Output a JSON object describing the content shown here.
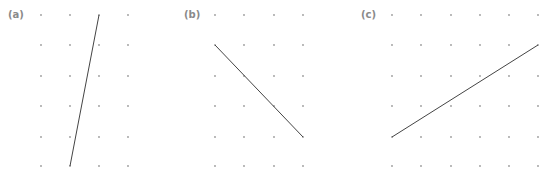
{
  "figure": {
    "panels": [
      {
        "label": "(a)",
        "label_pos": [
          8,
          9
        ],
        "cols_x": [
          41,
          70,
          99,
          128
        ],
        "rows_y": [
          15,
          45,
          76,
          106,
          137,
          166
        ],
        "segment": {
          "x1": 99,
          "y1": 15,
          "x2": 70,
          "y2": 166
        }
      },
      {
        "label": "(b)",
        "label_pos": [
          184,
          9
        ],
        "cols_x": [
          215,
          244,
          274,
          303
        ],
        "rows_y": [
          15,
          45,
          76,
          106,
          137,
          166
        ],
        "segment": {
          "x1": 215,
          "y1": 45,
          "x2": 303,
          "y2": 137
        }
      },
      {
        "label": "(c)",
        "label_pos": [
          361,
          9
        ],
        "cols_x": [
          392,
          421,
          451,
          480,
          509,
          538
        ],
        "rows_y": [
          15,
          45,
          76,
          106,
          137,
          166
        ],
        "segment": {
          "x1": 392,
          "y1": 137,
          "x2": 538,
          "y2": 45
        }
      }
    ],
    "colors": {
      "dot": "#9a9a9a",
      "line": "#444444",
      "label": "#8a8a8a"
    }
  }
}
